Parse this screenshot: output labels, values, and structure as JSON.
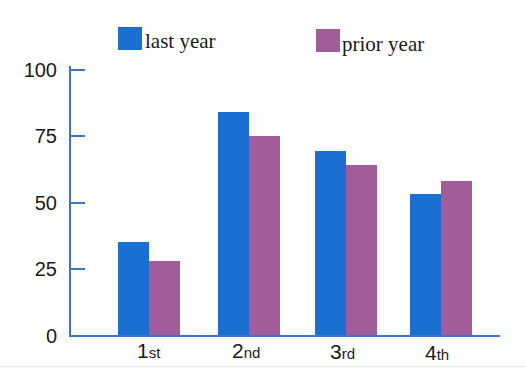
{
  "chart_data": {
    "type": "bar",
    "title": "",
    "xlabel": "",
    "ylabel": "",
    "categories": [
      "1st",
      "2nd",
      "3rd",
      "4th"
    ],
    "category_parts": [
      {
        "num": "1",
        "suffix": "st"
      },
      {
        "num": "2",
        "suffix": "nd"
      },
      {
        "num": "3",
        "suffix": "rd"
      },
      {
        "num": "4",
        "suffix": "th"
      }
    ],
    "series": [
      {
        "name": "last year",
        "color": "#1a6fd0",
        "values": [
          35,
          84,
          69,
          53
        ]
      },
      {
        "name": "prior year",
        "color": "#a05d9a",
        "values": [
          28,
          75,
          64,
          58
        ]
      }
    ],
    "ylim": [
      0,
      100
    ],
    "yticks": [
      0,
      25,
      50,
      75,
      100
    ],
    "ytick_labels": [
      "0",
      "25",
      "50",
      "75",
      "100"
    ],
    "grid": false,
    "legend_position": "top"
  },
  "legend": {
    "items": [
      {
        "label": "last year",
        "color": "#1a6fd0"
      },
      {
        "label": "prior year",
        "color": "#a05d9a"
      }
    ]
  },
  "axis_color": "#3d74c4"
}
